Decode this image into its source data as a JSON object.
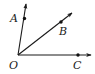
{
  "diagram": {
    "type": "geometry-rays",
    "vertex": {
      "label": "O",
      "x": 18,
      "y": 55,
      "label_x": 9,
      "label_y": 69
    },
    "rays": [
      {
        "name": "OA",
        "end_x": 26,
        "end_y": 4,
        "point": {
          "label": "A",
          "x": 24.5,
          "y": 18.5,
          "label_x": 10,
          "label_y": 22
        }
      },
      {
        "name": "OB",
        "end_x": 72,
        "end_y": 13,
        "point": {
          "label": "B",
          "x": 61,
          "y": 22,
          "label_x": 59,
          "label_y": 35
        }
      },
      {
        "name": "OC",
        "end_x": 91,
        "end_y": 55,
        "point": {
          "label": "C",
          "x": 78,
          "y": 55,
          "label_x": 73,
          "label_y": 69
        }
      }
    ],
    "colors": {
      "stroke": "#1a1a1a",
      "point": "#111111",
      "background": "#ffffff"
    }
  },
  "labels": {
    "O": "O",
    "A": "A",
    "B": "B",
    "C": "C"
  }
}
